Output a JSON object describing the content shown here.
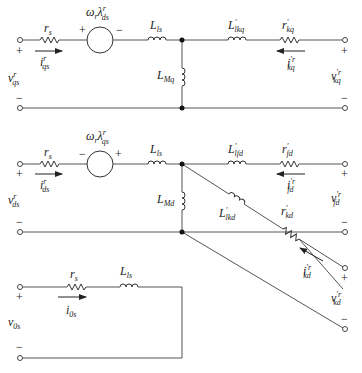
{
  "diagram": {
    "title": "",
    "q_axis": {
      "voltage": {
        "base": "v",
        "sub": "qs",
        "sup": "r"
      },
      "resistor": {
        "base": "r",
        "sub": "s"
      },
      "current": {
        "base": "i",
        "sub": "qs",
        "sup": "r"
      },
      "source": {
        "base": "ω",
        "sub1": "r",
        "mid": "λ",
        "sub2": "ds",
        "sup": "r",
        "left_sign": "+",
        "right_sign": "−"
      },
      "leakage": {
        "base": "L",
        "sub": "ls"
      },
      "magnetizing": {
        "base": "L",
        "sub": "Mq"
      },
      "rotor_inductance": {
        "base": "L",
        "sup": "′",
        "sub": "lkq"
      },
      "rotor_resistance": {
        "base": "r",
        "sup": "′",
        "sub": "kq"
      },
      "rotor_current": {
        "base": "i",
        "sup": "′r",
        "sub": "kq"
      },
      "rotor_voltage": {
        "base": "v",
        "sup": "′r",
        "sub": "kq"
      },
      "plus": "+",
      "minus": "−"
    },
    "d_axis": {
      "voltage": {
        "base": "v",
        "sub": "ds",
        "sup": "r"
      },
      "resistor": {
        "base": "r",
        "sub": "s"
      },
      "current": {
        "base": "i",
        "sub": "ds",
        "sup": "r"
      },
      "source": {
        "base": "ω",
        "sub1": "r",
        "mid": "λ",
        "sub2": "qs",
        "sup": "r",
        "left_sign": "−",
        "right_sign": "+"
      },
      "leakage": {
        "base": "L",
        "sub": "ls"
      },
      "magnetizing": {
        "base": "L",
        "sub": "Md"
      },
      "field_inductance": {
        "base": "L",
        "sup": "′",
        "sub": "lfd"
      },
      "field_resistance": {
        "base": "r",
        "sup": "′",
        "sub": "fd"
      },
      "field_current": {
        "base": "i",
        "sup": "′r",
        "sub": "fd"
      },
      "field_voltage": {
        "base": "v",
        "sup": "′r",
        "sub": "fd"
      },
      "damper_inductance": {
        "base": "L",
        "sup": "′",
        "sub": "lkd"
      },
      "damper_resistance": {
        "base": "r",
        "sup": "′",
        "sub": "kd"
      },
      "damper_current": {
        "base": "i",
        "sup": "′r",
        "sub": "kd"
      },
      "damper_voltage": {
        "base": "v",
        "sup": "′r",
        "sub": "kd"
      },
      "plus": "+",
      "minus": "−"
    },
    "zero_seq": {
      "voltage": {
        "base": "v",
        "sub": "0s"
      },
      "resistor": {
        "base": "r",
        "sub": "s"
      },
      "current": {
        "base": "i",
        "sub": "0s"
      },
      "leakage": {
        "base": "L",
        "sub": "ls"
      },
      "plus": "+",
      "minus": "−"
    }
  }
}
